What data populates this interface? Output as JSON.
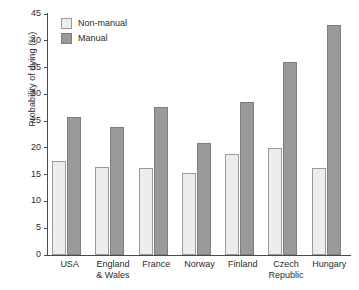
{
  "chart_data": {
    "type": "bar",
    "title": "",
    "xlabel": "",
    "ylabel": "Probability of dying (%)",
    "ylim": [
      0,
      45
    ],
    "yticks": [
      0,
      5,
      10,
      15,
      20,
      25,
      30,
      35,
      40,
      45
    ],
    "grid": false,
    "legend_position": "top-left",
    "categories": [
      "USA",
      "England\n& Wales",
      "France",
      "Norway",
      "Finland",
      "Czech\nRepublic",
      "Hungary"
    ],
    "category_lines": [
      [
        "USA"
      ],
      [
        "England",
        "& Wales"
      ],
      [
        "France"
      ],
      [
        "Norway"
      ],
      [
        "Finland"
      ],
      [
        "Czech",
        "Republic"
      ],
      [
        "Hungary"
      ]
    ],
    "series": [
      {
        "name": "Non-manual",
        "color": "#ededed",
        "values": [
          17.5,
          16.4,
          16.2,
          15.4,
          18.9,
          20.0,
          16.2
        ]
      },
      {
        "name": "Manual",
        "color": "#9a9a9a",
        "values": [
          25.8,
          23.9,
          27.6,
          20.9,
          28.5,
          36.0,
          43.0
        ]
      }
    ]
  },
  "legend": {
    "items": [
      {
        "label": "Non-manual",
        "swatch": "nonmanual"
      },
      {
        "label": "Manual",
        "swatch": "manual"
      }
    ]
  },
  "colors": {
    "nonmanual": "#ededed",
    "manual": "#9a9a9a",
    "axis": "#4a4a4a",
    "text": "#2b2b2b",
    "background": "#ffffff"
  }
}
